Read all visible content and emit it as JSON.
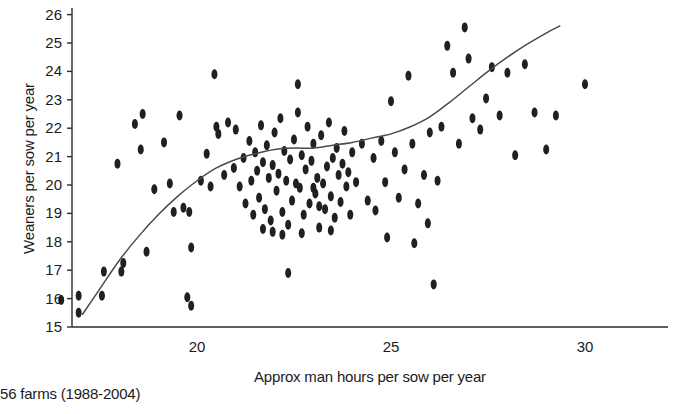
{
  "chart_data": {
    "type": "scatter",
    "title": "",
    "xlabel": "Approx man hours per sow per year",
    "ylabel": "Weaners per sow per year",
    "caption": "56 farms (1988-2004)",
    "xlim": [
      16.3,
      31.3
    ],
    "ylim": [
      15,
      26
    ],
    "xticks": [
      20,
      25,
      30
    ],
    "xtick_labels": [
      "20",
      "25",
      "30"
    ],
    "yticks": [
      15,
      16,
      17,
      18,
      19,
      20,
      21,
      22,
      23,
      24,
      25,
      26
    ],
    "ytick_labels": [
      "15",
      "16",
      "17",
      "18",
      "19",
      "20",
      "21",
      "22",
      "23",
      "24",
      "25",
      "26"
    ],
    "grid": false,
    "legend": null,
    "marker": {
      "shape": "ellipse",
      "color": "#221f1f",
      "width_px": 6,
      "height_px": 10
    },
    "series": [
      {
        "name": "Farm observations",
        "points": [
          [
            16.5,
            15.95
          ],
          [
            16.95,
            16.1
          ],
          [
            16.95,
            15.5
          ],
          [
            17.55,
            16.1
          ],
          [
            17.6,
            16.95
          ],
          [
            18.05,
            16.95
          ],
          [
            18.1,
            17.25
          ],
          [
            17.95,
            20.75
          ],
          [
            18.4,
            22.15
          ],
          [
            18.55,
            21.25
          ],
          [
            18.6,
            22.5
          ],
          [
            18.9,
            19.85
          ],
          [
            18.7,
            17.65
          ],
          [
            19.15,
            21.5
          ],
          [
            19.3,
            20.05
          ],
          [
            19.4,
            19.05
          ],
          [
            19.55,
            22.45
          ],
          [
            19.65,
            19.2
          ],
          [
            19.8,
            19.05
          ],
          [
            19.85,
            17.8
          ],
          [
            19.75,
            16.05
          ],
          [
            19.85,
            15.75
          ],
          [
            20.1,
            20.15
          ],
          [
            20.25,
            21.1
          ],
          [
            20.35,
            19.95
          ],
          [
            20.5,
            22.05
          ],
          [
            20.45,
            23.9
          ],
          [
            20.55,
            21.8
          ],
          [
            20.7,
            20.35
          ],
          [
            20.8,
            22.2
          ],
          [
            20.95,
            20.6
          ],
          [
            21.0,
            21.95
          ],
          [
            21.1,
            19.95
          ],
          [
            21.2,
            20.95
          ],
          [
            21.25,
            19.35
          ],
          [
            21.35,
            21.55
          ],
          [
            21.4,
            20.15
          ],
          [
            21.45,
            18.95
          ],
          [
            21.5,
            21.15
          ],
          [
            21.55,
            20.5
          ],
          [
            21.6,
            19.55
          ],
          [
            21.65,
            22.1
          ],
          [
            21.7,
            20.8
          ],
          [
            21.75,
            19.15
          ],
          [
            21.8,
            21.4
          ],
          [
            21.85,
            20.25
          ],
          [
            21.9,
            18.75
          ],
          [
            21.95,
            20.7
          ],
          [
            22.0,
            21.85
          ],
          [
            22.05,
            19.8
          ],
          [
            22.1,
            20.4
          ],
          [
            22.15,
            22.35
          ],
          [
            22.2,
            19.05
          ],
          [
            22.25,
            21.2
          ],
          [
            22.3,
            20.15
          ],
          [
            22.35,
            18.6
          ],
          [
            22.4,
            20.9
          ],
          [
            22.45,
            19.45
          ],
          [
            22.5,
            21.6
          ],
          [
            22.55,
            20.05
          ],
          [
            22.6,
            23.55
          ],
          [
            22.6,
            22.55
          ],
          [
            22.65,
            19.9
          ],
          [
            22.7,
            21.05
          ],
          [
            22.75,
            18.95
          ],
          [
            22.8,
            20.55
          ],
          [
            22.85,
            22.05
          ],
          [
            22.9,
            19.35
          ],
          [
            22.95,
            20.85
          ],
          [
            23.0,
            21.45
          ],
          [
            23.05,
            19.7
          ],
          [
            23.1,
            20.25
          ],
          [
            23.15,
            18.5
          ],
          [
            23.2,
            21.75
          ],
          [
            23.25,
            20.05
          ],
          [
            23.3,
            19.15
          ],
          [
            23.35,
            20.65
          ],
          [
            23.4,
            22.2
          ],
          [
            23.45,
            19.6
          ],
          [
            23.5,
            20.95
          ],
          [
            23.55,
            18.85
          ],
          [
            23.6,
            21.3
          ],
          [
            23.65,
            20.35
          ],
          [
            23.7,
            19.4
          ],
          [
            23.75,
            20.75
          ],
          [
            23.8,
            21.9
          ],
          [
            23.85,
            19.95
          ],
          [
            23.9,
            20.45
          ],
          [
            23.95,
            18.95
          ],
          [
            24.0,
            21.15
          ],
          [
            22.35,
            16.9
          ],
          [
            23.0,
            19.9
          ],
          [
            23.15,
            19.25
          ],
          [
            21.95,
            18.35
          ],
          [
            22.2,
            18.25
          ],
          [
            22.7,
            18.3
          ],
          [
            23.45,
            18.4
          ],
          [
            21.7,
            18.45
          ],
          [
            24.1,
            20.1
          ],
          [
            24.25,
            21.45
          ],
          [
            24.4,
            19.45
          ],
          [
            24.55,
            20.95
          ],
          [
            24.6,
            19.1
          ],
          [
            24.75,
            21.55
          ],
          [
            24.85,
            20.1
          ],
          [
            25.0,
            22.95
          ],
          [
            25.1,
            21.15
          ],
          [
            25.2,
            19.55
          ],
          [
            25.35,
            20.55
          ],
          [
            25.45,
            23.85
          ],
          [
            25.55,
            21.45
          ],
          [
            25.7,
            19.35
          ],
          [
            25.85,
            20.35
          ],
          [
            26.0,
            21.85
          ],
          [
            26.1,
            16.5
          ],
          [
            26.2,
            20.15
          ],
          [
            26.3,
            22.05
          ],
          [
            26.45,
            24.9
          ],
          [
            26.6,
            23.95
          ],
          [
            26.75,
            21.45
          ],
          [
            26.9,
            25.55
          ],
          [
            27.0,
            24.45
          ],
          [
            27.1,
            22.35
          ],
          [
            27.3,
            21.95
          ],
          [
            27.45,
            23.05
          ],
          [
            27.6,
            24.15
          ],
          [
            27.8,
            22.45
          ],
          [
            28.0,
            23.95
          ],
          [
            28.2,
            21.05
          ],
          [
            28.45,
            24.25
          ],
          [
            28.7,
            22.55
          ],
          [
            29.0,
            21.25
          ],
          [
            29.25,
            22.45
          ],
          [
            30.0,
            23.55
          ],
          [
            25.6,
            17.95
          ],
          [
            25.95,
            18.65
          ],
          [
            24.9,
            18.15
          ]
        ]
      }
    ],
    "trend_line": {
      "name": "smoothed fit",
      "color": "#4a4a4a",
      "points": [
        [
          17.05,
          15.45
        ],
        [
          17.5,
          16.35
        ],
        [
          18.0,
          17.35
        ],
        [
          18.5,
          18.2
        ],
        [
          19.0,
          18.95
        ],
        [
          19.5,
          19.6
        ],
        [
          20.0,
          20.15
        ],
        [
          20.5,
          20.6
        ],
        [
          21.0,
          20.9
        ],
        [
          21.5,
          21.1
        ],
        [
          22.0,
          21.25
        ],
        [
          22.5,
          21.3
        ],
        [
          23.0,
          21.3
        ],
        [
          23.5,
          21.4
        ],
        [
          24.0,
          21.5
        ],
        [
          24.5,
          21.65
        ],
        [
          25.0,
          21.8
        ],
        [
          25.5,
          22.05
        ],
        [
          26.0,
          22.4
        ],
        [
          26.5,
          22.9
        ],
        [
          27.0,
          23.45
        ],
        [
          27.5,
          24.0
        ],
        [
          28.0,
          24.5
        ],
        [
          28.5,
          24.95
        ],
        [
          29.0,
          25.35
        ],
        [
          29.35,
          25.6
        ]
      ]
    }
  },
  "geometry": {
    "x_axis_y_px": 327,
    "y_axis_x_px": 72,
    "px_per_x_unit": 38.8,
    "px_per_y_unit": 28.4,
    "x_origin_px": 197,
    "y_origin_px": 327
  }
}
